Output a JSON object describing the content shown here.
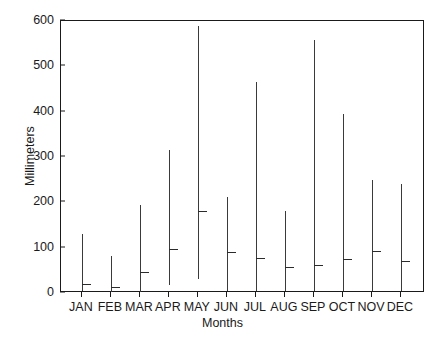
{
  "chart_data": {
    "type": "bar",
    "subtype": "range-with-mean-marker",
    "title": "",
    "xlabel": "Months",
    "ylabel": "Millimeters",
    "ylim": [
      0,
      600
    ],
    "yticks": [
      0,
      100,
      200,
      300,
      400,
      500,
      600
    ],
    "ytick_labels": [
      "0",
      "100",
      "200",
      "300",
      "400",
      "500",
      "600"
    ],
    "grid": false,
    "legend": null,
    "categories": [
      "JAN",
      "FEB",
      "MAR",
      "APR",
      "MAY",
      "JUN",
      "JUL",
      "AUG",
      "SEP",
      "OCT",
      "NOV",
      "DEC"
    ],
    "series": [
      {
        "name": "Maximum",
        "values": [
          130,
          82,
          194,
          315,
          590,
          212,
          465,
          180,
          558,
          395,
          250,
          240
        ]
      },
      {
        "name": "Minimum",
        "values": [
          5,
          3,
          2,
          18,
          30,
          5,
          5,
          5,
          5,
          5,
          5,
          5
        ]
      },
      {
        "name": "Mean",
        "values": [
          20,
          13,
          47,
          97,
          180,
          90,
          78,
          57,
          62,
          75,
          93,
          70
        ]
      }
    ],
    "axis_color": "#1a1a1a",
    "bar_color": "#3a3a3a"
  },
  "figure": {
    "xlabel": "Months",
    "ylabel": "Millimeters"
  }
}
